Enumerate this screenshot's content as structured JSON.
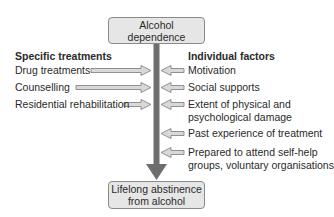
{
  "top_box": {
    "label": "Alcohol dependence"
  },
  "bottom_box": {
    "line1": "Lifelong abstinence",
    "line2": "from alcohol"
  },
  "left": {
    "header": "Specific treatments",
    "items": [
      {
        "label": "Drug treatments"
      },
      {
        "label": "Counselling"
      },
      {
        "label": "Residential rehabilitation"
      }
    ]
  },
  "right": {
    "header": "Individual factors",
    "items": [
      {
        "line1": "Motivation"
      },
      {
        "line1": "Social supports"
      },
      {
        "line1": "Extent of physical and",
        "line2": "psychological damage"
      },
      {
        "line1": "Past experience of treatment"
      },
      {
        "line1": "Prepared to attend self-help",
        "line2": "groups, voluntary organisations"
      }
    ]
  },
  "colors": {
    "shaft": "#6e6e6e",
    "box_fill": "#e6e6e6",
    "arrow_fill": "#d9d9d9",
    "arrow_stroke": "#7a7a7a"
  }
}
